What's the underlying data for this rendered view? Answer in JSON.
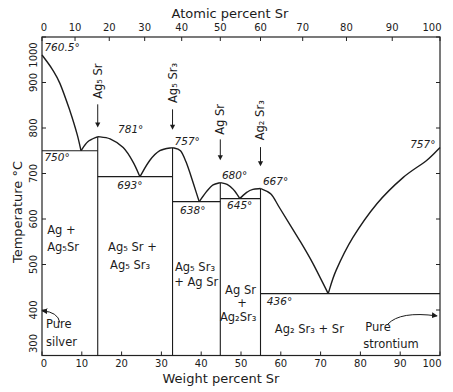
{
  "chart_data": {
    "type": "line",
    "subtype": "binary-phase-diagram",
    "title": "",
    "xlabel": "Weight percent Sr",
    "ylabel": "Temperature °C",
    "grid": false,
    "legend": "none",
    "x_axis_bottom": {
      "label": "Weight percent Sr",
      "range": [
        0,
        100
      ],
      "ticks": [
        0,
        10,
        20,
        30,
        40,
        50,
        60,
        70,
        80,
        90,
        100
      ]
    },
    "x_axis_top": {
      "label": "Atomic percent Sr",
      "ticks": [
        {
          "label": "0",
          "wt": 0
        },
        {
          "label": "10",
          "wt": 8.3
        },
        {
          "label": "20",
          "wt": 16.9
        },
        {
          "label": "30",
          "wt": 25.8
        },
        {
          "label": "40",
          "wt": 35.1
        },
        {
          "label": "50",
          "wt": 44.8
        },
        {
          "label": "60",
          "wt": 54.9
        },
        {
          "label": "70",
          "wt": 65.5
        },
        {
          "label": "80",
          "wt": 76.5
        },
        {
          "label": "90",
          "wt": 88.0
        },
        {
          "label": "100",
          "wt": 100
        }
      ]
    },
    "y_axis": {
      "label": "Temperature °C",
      "range": [
        300,
        1000
      ],
      "ticks": [
        300,
        400,
        500,
        600,
        700,
        800,
        900,
        1000
      ]
    },
    "liquidus": [
      [
        [
          0,
          960.5
        ],
        [
          2.5,
          930
        ],
        [
          4.5,
          898
        ],
        [
          7,
          838
        ],
        [
          8.8,
          787
        ],
        [
          9.8,
          750
        ]
      ],
      [
        [
          9.8,
          750
        ],
        [
          11.5,
          770
        ],
        [
          14,
          781
        ]
      ],
      [
        [
          14,
          781
        ],
        [
          17.1,
          776
        ],
        [
          20.4,
          757
        ],
        [
          22.9,
          725
        ],
        [
          24.6,
          693
        ]
      ],
      [
        [
          24.6,
          693
        ],
        [
          27.1,
          729
        ],
        [
          29.6,
          750
        ],
        [
          32.8,
          757
        ]
      ],
      [
        [
          32.8,
          757
        ],
        [
          34.8,
          750
        ],
        [
          36.2,
          725
        ],
        [
          37.6,
          690
        ],
        [
          39.5,
          638
        ]
      ],
      [
        [
          39.5,
          638
        ],
        [
          41.5,
          662
        ],
        [
          43,
          675
        ],
        [
          44.8,
          680
        ]
      ],
      [
        [
          44.8,
          680
        ],
        [
          46.5,
          676
        ],
        [
          48.2,
          664
        ],
        [
          49.7,
          645
        ]
      ],
      [
        [
          49.7,
          645
        ],
        [
          51.5,
          659
        ],
        [
          53,
          665
        ],
        [
          54.9,
          667
        ]
      ],
      [
        [
          54.9,
          667
        ],
        [
          57.5,
          655
        ],
        [
          59.8,
          623
        ],
        [
          64.8,
          552
        ],
        [
          68.1,
          502
        ],
        [
          71.9,
          436
        ]
      ],
      [
        [
          71.9,
          436
        ],
        [
          73.9,
          487
        ],
        [
          78.1,
          559
        ],
        [
          84.2,
          634
        ],
        [
          90.7,
          691
        ],
        [
          96.7,
          729
        ],
        [
          100,
          757
        ]
      ]
    ],
    "invariant_lines": [
      {
        "T": 750,
        "from": 0,
        "to": 14
      },
      {
        "T": 693,
        "from": 14,
        "to": 32.8
      },
      {
        "T": 638,
        "from": 32.8,
        "to": 44.8
      },
      {
        "T": 645,
        "from": 44.8,
        "to": 54.9
      },
      {
        "T": 436,
        "from": 54.9,
        "to": 100
      }
    ],
    "compounds": [
      {
        "formula": "Ag₅ Sr",
        "wt": 14.0,
        "melt": 781,
        "label_T": 903,
        "arrow": [
          852,
          801
        ]
      },
      {
        "formula": "Ag₅ Sr₃",
        "wt": 32.8,
        "melt": 757,
        "label_T": 899,
        "arrow": [
          841,
          796
        ]
      },
      {
        "formula": "Ag Sr",
        "wt": 44.8,
        "melt": 680,
        "label_T": 819,
        "arrow": [
          775,
          729
        ]
      },
      {
        "formula": "Ag₂ Sr₃",
        "wt": 54.9,
        "melt": 667,
        "label_T": 817,
        "arrow": [
          758,
          716
        ]
      }
    ],
    "temperature_annotations": [
      {
        "text": "760.5°",
        "w": 0.6,
        "T": 969
      },
      {
        "text": "750°",
        "w": 0.6,
        "T": 727
      },
      {
        "text": "781°",
        "w": 19.1,
        "T": 788
      },
      {
        "text": "693°",
        "w": 18.9,
        "T": 665
      },
      {
        "text": "757°",
        "w": 33.3,
        "T": 762
      },
      {
        "text": "638°",
        "w": 34.7,
        "T": 612
      },
      {
        "text": "680°",
        "w": 45.2,
        "T": 689
      },
      {
        "text": "645°",
        "w": 46.5,
        "T": 623
      },
      {
        "text": "667°",
        "w": 55.5,
        "T": 674
      },
      {
        "text": "436°",
        "w": 56.5,
        "T": 411
      },
      {
        "text": "757°",
        "w": 92.5,
        "T": 757
      }
    ],
    "phase_regions": [
      {
        "text": "Ag +",
        "w": 1.3,
        "T": 568,
        "anchor": "start"
      },
      {
        "text": "Ag₅Sr",
        "w": 1.3,
        "T": 530,
        "anchor": "start"
      },
      {
        "text": "Ag₅ Sr +",
        "w": 16.6,
        "T": 530,
        "anchor": "start"
      },
      {
        "text": "Ag₅ Sr₃",
        "w": 17.1,
        "T": 491,
        "anchor": "start"
      },
      {
        "text": "Ag₅ Sr₃",
        "w": 33.4,
        "T": 486,
        "anchor": "start"
      },
      {
        "text": "+ Ag Sr",
        "w": 33.2,
        "T": 453,
        "anchor": "start"
      },
      {
        "text": "Ag Sr",
        "w": 46.0,
        "T": 436,
        "anchor": "start"
      },
      {
        "text": "+",
        "w": 50.3,
        "T": 407,
        "anchor": "middle"
      },
      {
        "text": "Ag₂Sr₃",
        "w": 44.7,
        "T": 376,
        "anchor": "start"
      },
      {
        "text": "Ag₂ Sr₃ + Sr",
        "w": 58.5,
        "T": 350,
        "anchor": "start"
      },
      {
        "text": "Pure",
        "w": 1.0,
        "T": 361,
        "anchor": "start"
      },
      {
        "text": "silver",
        "w": 1.0,
        "T": 321,
        "anchor": "start"
      },
      {
        "text": "Pure",
        "w": 81.2,
        "T": 354,
        "anchor": "start"
      },
      {
        "text": "strontium",
        "w": 80.7,
        "T": 317,
        "anchor": "start"
      }
    ],
    "pointers": [
      {
        "name": "pure-silver-arrow",
        "start": [
          4.5,
          372
        ],
        "ctrl": [
          4.0,
          396
        ],
        "end": [
          0.1,
          398
        ]
      },
      {
        "name": "pure-strontium-arrow",
        "start": [
          86.9,
          369
        ],
        "ctrl": [
          90.0,
          398
        ],
        "end": [
          99.2,
          387
        ]
      }
    ]
  }
}
